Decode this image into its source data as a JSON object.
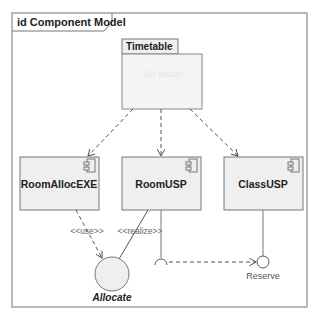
{
  "frame": {
    "title": "id Component Model"
  },
  "package": {
    "name": "Timetable",
    "faded_text": "Tab Model"
  },
  "components": [
    {
      "name": "RoomAllocEXE"
    },
    {
      "name": "RoomUSP"
    },
    {
      "name": "ClassUSP"
    }
  ],
  "interfaces": {
    "allocate": {
      "name": "Allocate"
    },
    "reserve": {
      "name": "Reserve"
    }
  },
  "stereotypes": {
    "use": "<<use>>",
    "realize": "<<realize>>"
  },
  "colors": {
    "box_fill": "#efefef",
    "border": "#6e6e6e",
    "line": "#555555"
  }
}
